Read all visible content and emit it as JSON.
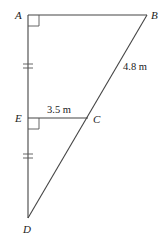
{
  "diagram": {
    "type": "geometry",
    "points": {
      "A": {
        "label": "A",
        "x": 28,
        "y": 15
      },
      "B": {
        "label": "B",
        "x": 147,
        "y": 15
      },
      "C": {
        "label": "C",
        "x": 88,
        "y": 118
      },
      "D": {
        "label": "D",
        "x": 28,
        "y": 218
      },
      "E": {
        "label": "E",
        "x": 28,
        "y": 118
      }
    },
    "segments": [
      "AB",
      "AD",
      "BD",
      "EC"
    ],
    "measurements": {
      "BC": "4.8 m",
      "EC": "3.5 m"
    },
    "right_angles": [
      "A",
      "E"
    ],
    "equal_ticks": [
      "AE",
      "ED"
    ]
  }
}
